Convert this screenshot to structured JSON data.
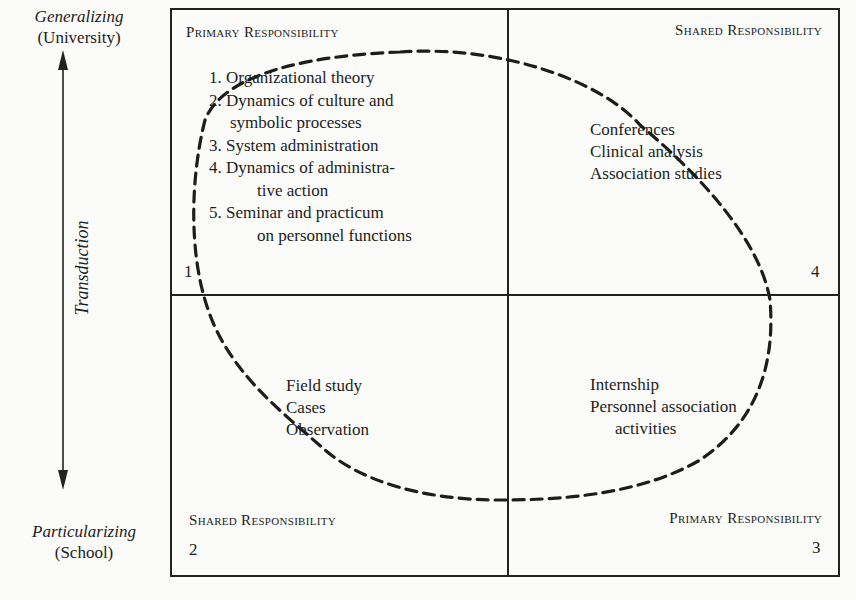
{
  "axis": {
    "top": {
      "label": "Generalizing",
      "sub": "(University)"
    },
    "bottom": {
      "label": "Particularizing",
      "sub": "(School)"
    },
    "arrow_label": "Transduction"
  },
  "quadrants": {
    "q1": {
      "number": "1",
      "title": "Primary Responsibility",
      "items": [
        {
          "num": "1.",
          "line1": "Organizational theory",
          "line2": ""
        },
        {
          "num": "2.",
          "line1": "Dynamics of culture and",
          "line2": "symbolic processes"
        },
        {
          "num": "3.",
          "line1": "System administration",
          "line2": ""
        },
        {
          "num": "4.",
          "line1": "Dynamics of administra-",
          "line2": "tive action"
        },
        {
          "num": "5.",
          "line1": "Seminar and practicum",
          "line2": "on personnel functions"
        }
      ]
    },
    "q4": {
      "number": "4",
      "title": "Shared Responsibility",
      "items": [
        "Conferences",
        "Clinical analysis",
        "Association studies"
      ]
    },
    "q2": {
      "number": "2",
      "title": "Shared Responsibility",
      "items": [
        "Field study",
        "Cases",
        "Observation"
      ]
    },
    "q3": {
      "number": "3",
      "title": "Primary Responsibility",
      "items": [
        "Internship",
        "Personnel association",
        "activities"
      ]
    }
  },
  "colors": {
    "ink": "#1d1d1d",
    "paper": "#fbfbf9"
  }
}
